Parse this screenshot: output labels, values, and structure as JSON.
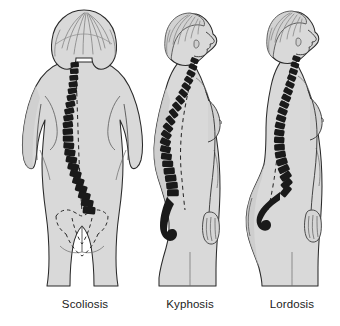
{
  "illustration": {
    "title": "Spinal curvature disorders comparison",
    "background_color": "#ffffff",
    "body_fill": "#d9d9d9",
    "body_shade": "#c6c6c6",
    "outline_color": "#2a2a2a",
    "spine_color": "#1a1a1a",
    "dashed_line_color": "#2b2b2b",
    "caption_color": "#1b1b1b"
  },
  "figures": [
    {
      "id": "scoliosis",
      "label": "Scoliosis",
      "view": "posterior",
      "description": "Rear view of a female figure showing a lateral S-shaped curvature of the spine with a dashed vertical plumb line and dashed pelvic outline",
      "spine_orientation": "lateral-s-curve",
      "reference_line": "vertical-plumb-line",
      "center_x": 85
    },
    {
      "id": "kyphosis",
      "label": "Kyphosis",
      "view": "lateral-right-facing",
      "description": "Side view of a female figure showing exaggerated outward rounding of the thoracic spine producing a hunched upper back",
      "spine_orientation": "exaggerated-thoracic-convexity",
      "reference_line": "normal-spine-dashed",
      "center_x": 190
    },
    {
      "id": "lordosis",
      "label": "Lordosis",
      "view": "lateral-right-facing",
      "description": "Side view of a female figure showing exaggerated inward curvature of the lumbar spine with protruding abdomen and buttocks",
      "spine_orientation": "exaggerated-lumbar-concavity",
      "reference_line": "normal-spine-dashed",
      "center_x": 292
    }
  ]
}
